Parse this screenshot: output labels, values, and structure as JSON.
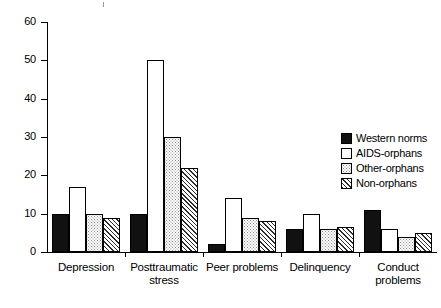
{
  "chart_data": {
    "type": "bar",
    "title": "",
    "xlabel": "",
    "ylabel": "",
    "ylim": [
      0,
      60
    ],
    "yticks": [
      0,
      10,
      20,
      30,
      40,
      50,
      60
    ],
    "grid": false,
    "legend_position": "right",
    "categories": [
      "Depression",
      "Posttraumatic stress",
      "Peer problems",
      "Delinquency",
      "Conduct problems"
    ],
    "series": [
      {
        "name": "Western norms",
        "fill": "solid",
        "values": [
          10,
          10,
          2,
          6,
          11
        ]
      },
      {
        "name": "AIDS-orphans",
        "fill": "open",
        "values": [
          17,
          50,
          14,
          10,
          6
        ]
      },
      {
        "name": "Other-orphans",
        "fill": "dots",
        "values": [
          10,
          30,
          9,
          6,
          4
        ]
      },
      {
        "name": "Non-orphans",
        "fill": "hatch",
        "values": [
          9,
          22,
          8,
          6.5,
          5
        ]
      }
    ]
  },
  "axis": {
    "y_tick_labels": [
      "0",
      "10",
      "20",
      "30",
      "40",
      "50",
      "60"
    ]
  },
  "categories_display": [
    {
      "line1": "Depression",
      "line2": ""
    },
    {
      "line1": "Posttraumatic",
      "line2": "stress"
    },
    {
      "line1": "Peer problems",
      "line2": ""
    },
    {
      "line1": "Delinquency",
      "line2": ""
    },
    {
      "line1": "Conduct",
      "line2": "problems"
    }
  ],
  "legend": {
    "items": [
      {
        "label": "Western norms",
        "fill": "solid"
      },
      {
        "label": "AIDS-orphans",
        "fill": "open"
      },
      {
        "label": "Other-orphans",
        "fill": "dots"
      },
      {
        "label": "Non-orphans",
        "fill": "hatch"
      }
    ]
  },
  "colors": {
    "solid": "#111111",
    "open": "#ffffff",
    "dots": "#d9d9d9",
    "hatch": "#2b2b2b",
    "axis": "#000000"
  }
}
